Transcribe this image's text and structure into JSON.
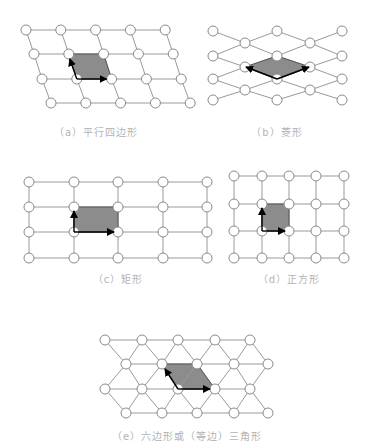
{
  "captions": {
    "a": "（a）平行四边形",
    "b": "（b）菱形",
    "c": "（c）矩形",
    "d": "（d）正方形",
    "e": "（e）六边形或（等边）三角形"
  },
  "colors": {
    "line": "#9a9a9a",
    "node_stroke": "#8a8a8a",
    "fill": "#8c8c8c",
    "arrow": "#000000",
    "caption": "#b3b3b3"
  }
}
